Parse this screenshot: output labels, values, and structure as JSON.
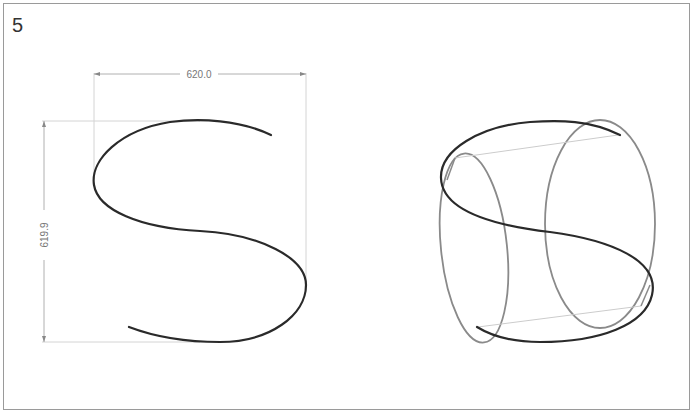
{
  "figure": {
    "panel_number": "5",
    "left_view": {
      "description": "S-curve with dimensions",
      "width_dimension": "620.0",
      "height_dimension": "619.9"
    },
    "right_view": {
      "description": "S-curve wrapped on cylinder (perspective view)"
    },
    "colors": {
      "curve": "#2a2a2a",
      "cylinder": "#8a8a8a",
      "guide": "#c8c8c8",
      "dimension": "#9a9a9a",
      "frame": "#9a9a9a"
    }
  }
}
